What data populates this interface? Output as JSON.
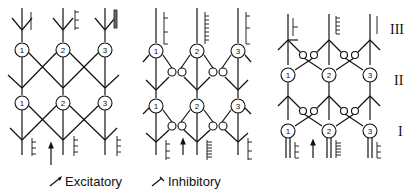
{
  "diagram": {
    "panels": [
      {
        "name": "panel-left",
        "neurons": [
          "1",
          "2",
          "3"
        ]
      },
      {
        "name": "panel-middle",
        "neurons": [
          "1",
          "2",
          "3"
        ]
      },
      {
        "name": "panel-right",
        "neurons": [
          "1",
          "2",
          "3"
        ]
      }
    ],
    "layers": [
      "III",
      "II",
      "I"
    ],
    "legend": {
      "excitatory": "Excitatory",
      "inhibitory": "Inhibitory"
    }
  }
}
